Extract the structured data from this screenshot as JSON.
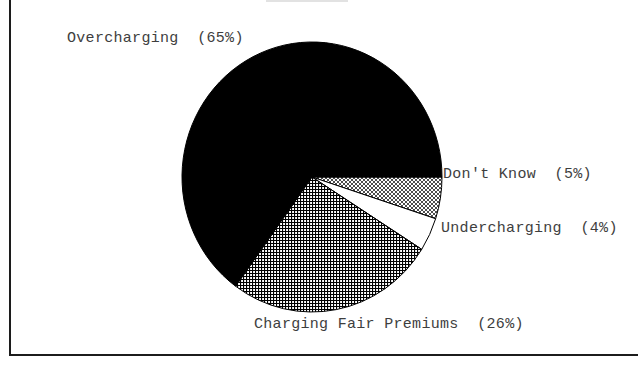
{
  "chart_data": {
    "type": "pie",
    "title": "",
    "categories": [
      "Don't Know",
      "Undercharging",
      "Charging Fair Premiums",
      "Overcharging"
    ],
    "values": [
      5,
      4,
      26,
      65
    ],
    "start_angle_deg": 0,
    "direction": "clockwise",
    "slices": [
      {
        "name": "Don't Know",
        "value": 5,
        "pattern": "diagonal-crosshatch",
        "label": "Don't Know  (5%)"
      },
      {
        "name": "Undercharging",
        "value": 4,
        "pattern": "white",
        "label": "Undercharging  (4%)"
      },
      {
        "name": "Charging Fair Premiums",
        "value": 26,
        "pattern": "grid-crosshatch",
        "label": "Charging Fair Premiums  (26%)"
      },
      {
        "name": "Overcharging",
        "value": 65,
        "pattern": "solid-black",
        "label": "Overcharging  (65%)"
      }
    ],
    "legend_position": "labels-around-pie",
    "grid": false
  },
  "labels": {
    "overcharging": "Overcharging  (65%)",
    "dont_know": "Don't Know  (5%)",
    "undercharging": "Undercharging  (4%)",
    "charging_fair_premiums": "Charging Fair Premiums  (26%)"
  },
  "colors": {
    "background": "#ffffff",
    "frame_border": "#1c1c1c",
    "text": "#3e3e3e",
    "slice_solid": "#000000",
    "slice_outline": "#000000",
    "slice_white": "#ffffff"
  }
}
